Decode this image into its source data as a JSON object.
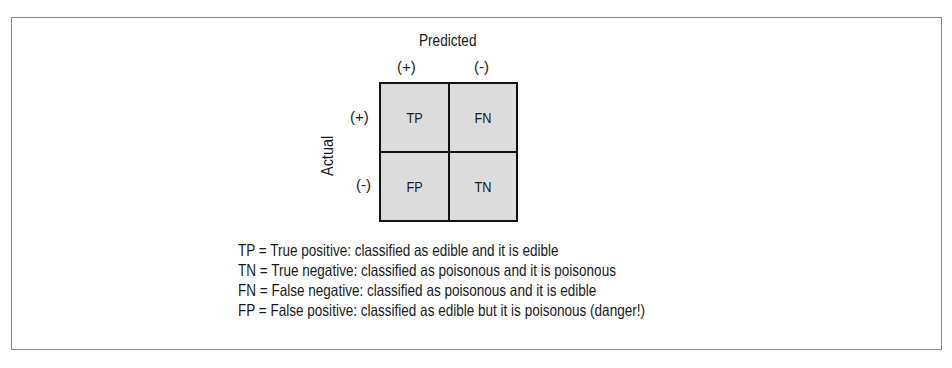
{
  "diagram": {
    "column_axis_label": "Predicted",
    "row_axis_label": "Actual",
    "column_labels": [
      "(+)",
      "(-)"
    ],
    "row_labels": [
      "(+)",
      "(-)"
    ],
    "cells": [
      [
        "TP",
        "FN"
      ],
      [
        "FP",
        "TN"
      ]
    ],
    "cell_fill_color": "#dcdcdc",
    "legend": [
      "TP = True positive: classified as edible and it is edible",
      "TN = True negative: classified as poisonous and it is poisonous",
      "FN = False negative: classified as poisonous and it is edible",
      "FP = False positive: classified as edible but it is poisonous (danger!)"
    ]
  }
}
